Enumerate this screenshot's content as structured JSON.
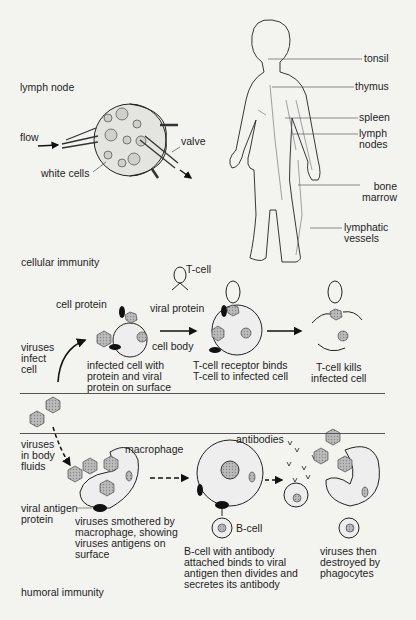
{
  "lymph_node": {
    "title": "lymph node",
    "flow": "flow",
    "valve": "valve",
    "white_cells": "white cells"
  },
  "body_figure": {
    "labels": [
      "tonsil",
      "thymus",
      "spleen",
      "lymph\nnodes",
      "bone\nmarrow",
      "lymphatic\nvessels"
    ]
  },
  "cellular": {
    "title": "cellular immunity",
    "t_cell": "T-cell",
    "cell_protein": "cell protein",
    "viral_protein": "viral protein",
    "cell_body": "cell body",
    "viruses_infect": "viruses\ninfect\ncell",
    "infected_cell": "infected cell with\nprotein and viral\nprotein on surface",
    "receptor_binds": "T-cell receptor binds\nT-cell to infected cell",
    "kills": "T-cell kills\ninfected cell"
  },
  "humoral": {
    "title": "humoral immunity",
    "viruses_body": "viruses\nin body\nfluids",
    "macrophage": "macrophage",
    "viral_antigen": "viral antigen\nprotein",
    "smothered": "viruses smothered by\nmacrophage, showing\nviruses antigens on\nsurface",
    "antibodies": "antibodies",
    "b_cell": "B-cell",
    "b_cell_desc": "B-cell with antibody\nattached binds to viral\nantigen then divides and\nsecretes its antibody",
    "destroyed": "viruses then\ndestroyed by\nphagocytes"
  }
}
